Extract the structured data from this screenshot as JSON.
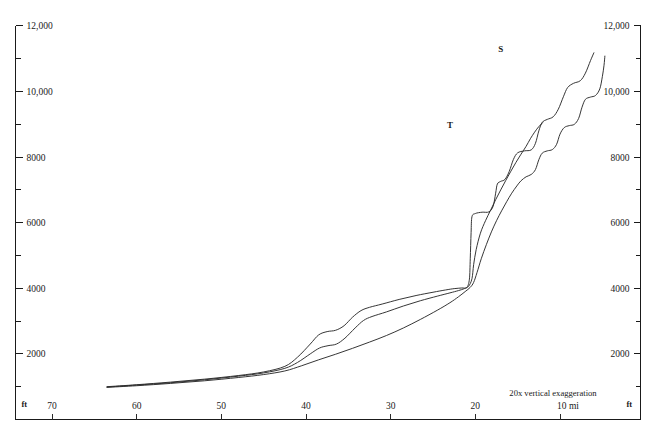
{
  "chart_data": {
    "type": "line",
    "title": "",
    "subtitle": "",
    "xlabel": "10 mi",
    "ylabel": "ft",
    "annotation": "20x vertical exaggeration",
    "grid": false,
    "legend_position": "inline-curve-labels",
    "xlim": [
      75,
      5
    ],
    "ylim": [
      0,
      12200
    ],
    "x_axis": {
      "unit": "mi",
      "direction": "decreasing-left-to-right",
      "tick_labels": [
        "70",
        "60",
        "50",
        "40",
        "30",
        "20",
        "10 mi"
      ],
      "tick_values": [
        70,
        60,
        50,
        40,
        30,
        20,
        10
      ],
      "unit_label_left": "ft",
      "unit_label_right": "ft"
    },
    "y_axis_left": {
      "unit": "ft",
      "major_tick_labels": [
        "12,000",
        "10,000",
        "8000",
        "6000",
        "4000",
        "2000"
      ],
      "major_tick_values": [
        12000,
        10000,
        8000,
        6000,
        4000,
        2000
      ],
      "minor_tick_values": [
        11000,
        9000,
        7000,
        5000,
        3000,
        1000
      ],
      "unit_label": "ft"
    },
    "y_axis_right": {
      "unit": "ft",
      "major_tick_labels": [
        "12,000",
        "10,000",
        "8000",
        "6000",
        "4000",
        "2000"
      ],
      "major_tick_values": [
        12000,
        10000,
        8000,
        6000,
        4000,
        2000
      ],
      "minor_tick_values": [
        11000,
        9000,
        7000,
        5000,
        3000,
        1000
      ],
      "unit_label": "ft"
    },
    "series": [
      {
        "name": "S",
        "label": "S",
        "label_x_mi": 17.0,
        "label_y_ft": 11200,
        "points_mi_ft": [
          [
            63.5,
            1000
          ],
          [
            60,
            1060
          ],
          [
            56,
            1140
          ],
          [
            52,
            1230
          ],
          [
            48,
            1340
          ],
          [
            45,
            1450
          ],
          [
            42.5,
            1620
          ],
          [
            41,
            1900
          ],
          [
            39.5,
            2300
          ],
          [
            38.5,
            2580
          ],
          [
            37.5,
            2680
          ],
          [
            36.5,
            2720
          ],
          [
            35.5,
            2860
          ],
          [
            34.5,
            3120
          ],
          [
            33.5,
            3320
          ],
          [
            32.5,
            3420
          ],
          [
            31,
            3520
          ],
          [
            29,
            3660
          ],
          [
            27,
            3780
          ],
          [
            25,
            3880
          ],
          [
            23.5,
            3950
          ],
          [
            22.5,
            3990
          ],
          [
            21.6,
            4010
          ],
          [
            21.0,
            4030
          ],
          [
            20.7,
            4280
          ],
          [
            20.6,
            4900
          ],
          [
            20.5,
            5700
          ],
          [
            20.4,
            6180
          ],
          [
            20.0,
            6280
          ],
          [
            19.2,
            6320
          ],
          [
            18.4,
            6330
          ],
          [
            17.9,
            6500
          ],
          [
            17.6,
            6900
          ],
          [
            17.4,
            7180
          ],
          [
            17.0,
            7260
          ],
          [
            16.5,
            7320
          ],
          [
            16.0,
            7560
          ],
          [
            15.5,
            7930
          ],
          [
            15.0,
            8130
          ],
          [
            14.2,
            8190
          ],
          [
            13.4,
            8220
          ],
          [
            12.9,
            8420
          ],
          [
            12.5,
            8800
          ],
          [
            12.1,
            9060
          ],
          [
            11.5,
            9150
          ],
          [
            10.8,
            9230
          ],
          [
            10.2,
            9460
          ],
          [
            9.6,
            9840
          ],
          [
            9.1,
            10120
          ],
          [
            8.4,
            10250
          ],
          [
            7.6,
            10330
          ],
          [
            7.0,
            10560
          ],
          [
            6.4,
            10940
          ],
          [
            6.0,
            11180
          ]
        ]
      },
      {
        "name": "T",
        "label": "T",
        "label_x_mi": 23.0,
        "label_y_ft": 8900,
        "points_mi_ft": [
          [
            63.5,
            990
          ],
          [
            60,
            1050
          ],
          [
            56,
            1120
          ],
          [
            52,
            1210
          ],
          [
            48,
            1320
          ],
          [
            45,
            1420
          ],
          [
            42.5,
            1560
          ],
          [
            41,
            1740
          ],
          [
            39.5,
            2000
          ],
          [
            38.4,
            2180
          ],
          [
            37.4,
            2250
          ],
          [
            36.4,
            2300
          ],
          [
            35.4,
            2480
          ],
          [
            34.2,
            2790
          ],
          [
            33.2,
            3020
          ],
          [
            32.2,
            3140
          ],
          [
            30.5,
            3280
          ],
          [
            28.5,
            3460
          ],
          [
            26.5,
            3620
          ],
          [
            24.5,
            3760
          ],
          [
            23.0,
            3860
          ],
          [
            22.0,
            3930
          ],
          [
            21.3,
            3990
          ],
          [
            20.8,
            4060
          ],
          [
            20.4,
            4290
          ],
          [
            20.2,
            4720
          ],
          [
            19.9,
            5180
          ],
          [
            19.4,
            5680
          ],
          [
            18.8,
            6060
          ],
          [
            18.2,
            6380
          ],
          [
            17.6,
            6700
          ],
          [
            17.0,
            7000
          ],
          [
            16.4,
            7290
          ],
          [
            15.8,
            7570
          ],
          [
            15.2,
            7840
          ],
          [
            14.6,
            8090
          ],
          [
            14.0,
            8330
          ],
          [
            13.5,
            8560
          ],
          [
            13.0,
            8760
          ],
          [
            12.5,
            8930
          ],
          [
            12.0,
            9060
          ]
        ]
      },
      {
        "name": "U",
        "label": "",
        "label_x_mi": null,
        "label_y_ft": null,
        "points_mi_ft": [
          [
            63.5,
            980
          ],
          [
            60,
            1030
          ],
          [
            56,
            1100
          ],
          [
            52,
            1180
          ],
          [
            48,
            1280
          ],
          [
            45,
            1370
          ],
          [
            42.5,
            1480
          ],
          [
            40.5,
            1640
          ],
          [
            38.5,
            1820
          ],
          [
            36.5,
            1990
          ],
          [
            34.5,
            2170
          ],
          [
            32.5,
            2360
          ],
          [
            30.5,
            2560
          ],
          [
            28.5,
            2790
          ],
          [
            26.5,
            3050
          ],
          [
            24.5,
            3330
          ],
          [
            23.0,
            3560
          ],
          [
            22.0,
            3740
          ],
          [
            21.2,
            3900
          ],
          [
            20.6,
            4030
          ],
          [
            20.2,
            4180
          ],
          [
            19.8,
            4480
          ],
          [
            19.3,
            4900
          ],
          [
            18.7,
            5330
          ],
          [
            18.1,
            5720
          ],
          [
            17.5,
            6060
          ],
          [
            16.9,
            6360
          ],
          [
            16.3,
            6640
          ],
          [
            15.7,
            6900
          ],
          [
            15.1,
            7120
          ],
          [
            14.6,
            7280
          ],
          [
            14.0,
            7400
          ],
          [
            13.4,
            7470
          ],
          [
            12.9,
            7620
          ],
          [
            12.5,
            7920
          ],
          [
            12.1,
            8120
          ],
          [
            11.5,
            8190
          ],
          [
            10.9,
            8230
          ],
          [
            10.4,
            8390
          ],
          [
            10.0,
            8700
          ],
          [
            9.5,
            8900
          ],
          [
            8.9,
            8960
          ],
          [
            8.3,
            9000
          ],
          [
            7.8,
            9180
          ],
          [
            7.4,
            9520
          ],
          [
            7.0,
            9760
          ],
          [
            6.4,
            9830
          ],
          [
            5.8,
            9880
          ],
          [
            5.3,
            10080
          ],
          [
            5.0,
            10450
          ],
          [
            4.8,
            10800
          ],
          [
            4.7,
            11080
          ]
        ]
      }
    ]
  },
  "labels": {
    "curve_s": "S",
    "curve_t": "T",
    "exaggeration_note": "20x vertical exaggeration",
    "ft_bottom_left": "ft",
    "ft_bottom_right": "ft",
    "x_unit_last": "10 mi"
  },
  "colors": {
    "stroke": "#2b2b2b",
    "axis": "#1a1a1a",
    "background": "#ffffff"
  }
}
